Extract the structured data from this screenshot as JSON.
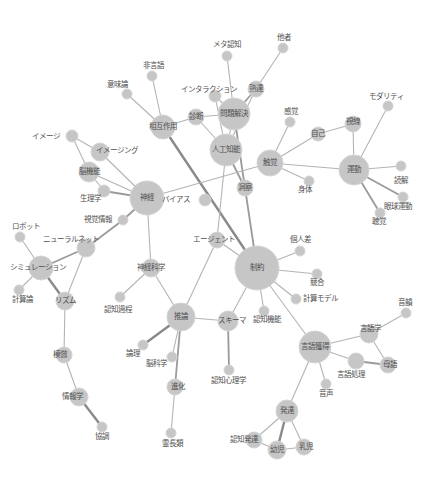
{
  "diagram": {
    "type": "network-graph",
    "colors": {
      "node": "#c6c6c6",
      "edge": "#b4b4b4",
      "edge_strong": "#8a8a8a",
      "label": "#505050",
      "background": "#ffffff"
    },
    "nodes": [
      {
        "id": "metacog",
        "label": "メタ認知",
        "x": 227,
        "y": 56,
        "r": 5,
        "lx": 227,
        "ly": 45
      },
      {
        "id": "tasha",
        "label": "他者",
        "x": 283,
        "y": 48,
        "r": 5,
        "lx": 284,
        "ly": 38
      },
      {
        "id": "higengo",
        "label": "非言語",
        "x": 152,
        "y": 76,
        "r": 5,
        "lx": 153,
        "ly": 66
      },
      {
        "id": "imiron",
        "label": "意味論",
        "x": 127,
        "y": 94,
        "r": 5,
        "lx": 117,
        "ly": 85
      },
      {
        "id": "interaction",
        "label": "インタラクション",
        "x": 215,
        "y": 96,
        "r": 6,
        "lx": 209,
        "ly": 90
      },
      {
        "id": "jukutatsu",
        "label": "熟達",
        "x": 256,
        "y": 89,
        "r": 8,
        "lx": 256,
        "ly": 89
      },
      {
        "id": "mondai",
        "label": "問題解決",
        "x": 234,
        "y": 114,
        "r": 16,
        "lx": 234,
        "ly": 114
      },
      {
        "id": "shindan",
        "label": "診断",
        "x": 196,
        "y": 117,
        "r": 8,
        "lx": 196,
        "ly": 117
      },
      {
        "id": "sougo",
        "label": "相互作用",
        "x": 163,
        "y": 127,
        "r": 12,
        "lx": 163,
        "ly": 127
      },
      {
        "id": "kankaku",
        "label": "感覚",
        "x": 290,
        "y": 122,
        "r": 5,
        "lx": 291,
        "ly": 112
      },
      {
        "id": "jiko",
        "label": "自己",
        "x": 318,
        "y": 134,
        "r": 7,
        "lx": 318,
        "ly": 134
      },
      {
        "id": "shisen",
        "label": "視線",
        "x": 353,
        "y": 124,
        "r": 8,
        "lx": 353,
        "ly": 122
      },
      {
        "id": "modality",
        "label": "モダリティ",
        "x": 388,
        "y": 106,
        "r": 5,
        "lx": 386,
        "ly": 97
      },
      {
        "id": "ai",
        "label": "人工知能",
        "x": 226,
        "y": 150,
        "r": 16,
        "lx": 226,
        "ly": 150
      },
      {
        "id": "image",
        "label": "イメージ",
        "x": 72,
        "y": 136,
        "r": 6,
        "lx": 46,
        "ly": 137
      },
      {
        "id": "imaging",
        "label": "イメージング",
        "x": 100,
        "y": 152,
        "r": 9,
        "lx": 117,
        "ly": 151
      },
      {
        "id": "nokino",
        "label": "脳機能",
        "x": 89,
        "y": 172,
        "r": 10,
        "lx": 89,
        "ly": 172
      },
      {
        "id": "shokkaku",
        "label": "触覚",
        "x": 270,
        "y": 163,
        "r": 13,
        "lx": 270,
        "ly": 163
      },
      {
        "id": "undou",
        "label": "運動",
        "x": 354,
        "y": 170,
        "r": 15,
        "lx": 354,
        "ly": 170
      },
      {
        "id": "dokkai",
        "label": "読解",
        "x": 401,
        "y": 166,
        "r": 5,
        "lx": 401,
        "ly": 181
      },
      {
        "id": "shintai",
        "label": "身体",
        "x": 309,
        "y": 181,
        "r": 5,
        "lx": 305,
        "ly": 190
      },
      {
        "id": "gankyu",
        "label": "眼球運動",
        "x": 403,
        "y": 197,
        "r": 5,
        "lx": 398,
        "ly": 207
      },
      {
        "id": "choukaku",
        "label": "聴覚",
        "x": 380,
        "y": 213,
        "r": 5,
        "lx": 379,
        "ly": 222
      },
      {
        "id": "dousatsu",
        "label": "洞察",
        "x": 245,
        "y": 188,
        "r": 8,
        "lx": 245,
        "ly": 188
      },
      {
        "id": "shinkei",
        "label": "神経",
        "x": 147,
        "y": 198,
        "r": 17,
        "lx": 147,
        "ly": 198
      },
      {
        "id": "seirigaku",
        "label": "生理学",
        "x": 104,
        "y": 191,
        "r": 6,
        "lx": 90,
        "ly": 199
      },
      {
        "id": "bias",
        "label": "バイアス",
        "x": 205,
        "y": 200,
        "r": 6,
        "lx": 176,
        "ly": 200
      },
      {
        "id": "shikaku",
        "label": "視覚情報",
        "x": 123,
        "y": 220,
        "r": 5,
        "lx": 98,
        "ly": 220
      },
      {
        "id": "agent",
        "label": "エージェント",
        "x": 217,
        "y": 240,
        "r": 8,
        "lx": 214,
        "ly": 240
      },
      {
        "id": "robot",
        "label": "ロボット",
        "x": 20,
        "y": 237,
        "r": 5,
        "lx": 26,
        "ly": 227
      },
      {
        "id": "neural",
        "label": "ニューラルネット",
        "x": 86,
        "y": 248,
        "r": 9,
        "lx": 71,
        "ly": 240
      },
      {
        "id": "simulation",
        "label": "シミュレーション",
        "x": 41,
        "y": 268,
        "r": 12,
        "lx": 38,
        "ly": 268
      },
      {
        "id": "seiyaku",
        "label": "制約",
        "x": 257,
        "y": 268,
        "r": 22,
        "lx": 257,
        "ly": 268
      },
      {
        "id": "kojinsa",
        "label": "個人差",
        "x": 300,
        "y": 251,
        "r": 5,
        "lx": 300,
        "ly": 240
      },
      {
        "id": "kyougou",
        "label": "競合",
        "x": 317,
        "y": 274,
        "r": 5,
        "lx": 317,
        "ly": 283
      },
      {
        "id": "shinkeikagaku",
        "label": "神経科学",
        "x": 151,
        "y": 268,
        "r": 9,
        "lx": 151,
        "ly": 268
      },
      {
        "id": "keisanron",
        "label": "計算論",
        "x": 19,
        "y": 290,
        "r": 5,
        "lx": 22,
        "ly": 300
      },
      {
        "id": "rhythm",
        "label": "リズム",
        "x": 65,
        "y": 301,
        "r": 9,
        "lx": 65,
        "ly": 301
      },
      {
        "id": "keisanmodel",
        "label": "計算モデル",
        "x": 296,
        "y": 299,
        "r": 5,
        "lx": 320,
        "ly": 299
      },
      {
        "id": "ninchikatei",
        "label": "認知過程",
        "x": 120,
        "y": 297,
        "r": 5,
        "lx": 118,
        "ly": 310
      },
      {
        "id": "ninchikino",
        "label": "認知機能",
        "x": 264,
        "y": 311,
        "r": 5,
        "lx": 267,
        "ly": 320
      },
      {
        "id": "suiron",
        "label": "推論",
        "x": 181,
        "y": 317,
        "r": 14,
        "lx": 181,
        "ly": 317
      },
      {
        "id": "schema",
        "label": "スキーマ",
        "x": 228,
        "y": 321,
        "r": 10,
        "lx": 232,
        "ly": 321
      },
      {
        "id": "onin",
        "label": "音韻",
        "x": 406,
        "y": 313,
        "r": 5,
        "lx": 405,
        "ly": 303
      },
      {
        "id": "gengogaku",
        "label": "言語学",
        "x": 369,
        "y": 334,
        "r": 9,
        "lx": 370,
        "ly": 329
      },
      {
        "id": "gengokakutoku",
        "label": "言語獲得",
        "x": 315,
        "y": 347,
        "r": 16,
        "lx": 315,
        "ly": 347
      },
      {
        "id": "ronri",
        "label": "論理",
        "x": 143,
        "y": 345,
        "r": 5,
        "lx": 133,
        "ly": 354
      },
      {
        "id": "noukagaku",
        "label": "脳科学",
        "x": 172,
        "y": 357,
        "r": 5,
        "lx": 156,
        "ly": 364
      },
      {
        "id": "ninchishinri",
        "label": "認知心理学",
        "x": 229,
        "y": 370,
        "r": 5,
        "lx": 228,
        "ly": 381
      },
      {
        "id": "bogo",
        "label": "母語",
        "x": 388,
        "y": 365,
        "r": 8,
        "lx": 390,
        "ly": 365
      },
      {
        "id": "gengoshori",
        "label": "言語処理",
        "x": 356,
        "y": 361,
        "r": 8,
        "lx": 351,
        "ly": 375
      },
      {
        "id": "mohou",
        "label": "模倣",
        "x": 64,
        "y": 355,
        "r": 8,
        "lx": 60,
        "ly": 355
      },
      {
        "id": "shinka",
        "label": "進化",
        "x": 175,
        "y": 387,
        "r": 8,
        "lx": 178,
        "ly": 387
      },
      {
        "id": "onsei",
        "label": "音声",
        "x": 326,
        "y": 384,
        "r": 5,
        "lx": 326,
        "ly": 394
      },
      {
        "id": "jouhougaku",
        "label": "情報学",
        "x": 79,
        "y": 397,
        "r": 9,
        "lx": 72,
        "ly": 397
      },
      {
        "id": "hattatsu",
        "label": "発達",
        "x": 287,
        "y": 411,
        "r": 11,
        "lx": 287,
        "ly": 411
      },
      {
        "id": "ninchihattatsu",
        "label": "認知発達",
        "x": 254,
        "y": 440,
        "r": 8,
        "lx": 244,
        "ly": 440
      },
      {
        "id": "youji",
        "label": "幼児",
        "x": 277,
        "y": 450,
        "r": 9,
        "lx": 277,
        "ly": 450
      },
      {
        "id": "nyuuji",
        "label": "乳児",
        "x": 304,
        "y": 447,
        "r": 8,
        "lx": 306,
        "ly": 447
      },
      {
        "id": "kyouchou",
        "label": "協調",
        "x": 102,
        "y": 427,
        "r": 5,
        "lx": 102,
        "ly": 437
      },
      {
        "id": "reichourui",
        "label": "霊長類",
        "x": 171,
        "y": 433,
        "r": 5,
        "lx": 172,
        "ly": 444
      }
    ],
    "edges": [
      [
        "metacog",
        "mondai",
        1
      ],
      [
        "tasha",
        "jukutatsu",
        1
      ],
      [
        "higengo",
        "sougo",
        1
      ],
      [
        "imiron",
        "sougo",
        1
      ],
      [
        "interaction",
        "mondai",
        1
      ],
      [
        "interaction",
        "ai",
        1
      ],
      [
        "jukutatsu",
        "mondai",
        2
      ],
      [
        "jukutatsu",
        "ai",
        1
      ],
      [
        "shindan",
        "sougo",
        1
      ],
      [
        "shindan",
        "mondai",
        1
      ],
      [
        "shindan",
        "ai",
        1
      ],
      [
        "sougo",
        "seiyaku",
        3
      ],
      [
        "mondai",
        "ai",
        1
      ],
      [
        "mondai",
        "dousatsu",
        2
      ],
      [
        "ai",
        "dousatsu",
        2
      ],
      [
        "ai",
        "agent",
        1
      ],
      [
        "dousatsu",
        "seiyaku",
        2
      ],
      [
        "shokkaku",
        "kankaku",
        1
      ],
      [
        "shokkaku",
        "jiko",
        1
      ],
      [
        "shokkaku",
        "shintai",
        1
      ],
      [
        "shokkaku",
        "undou",
        1
      ],
      [
        "shokkaku",
        "shinkei",
        1
      ],
      [
        "jiko",
        "shisen",
        1
      ],
      [
        "shisen",
        "undou",
        1
      ],
      [
        "modality",
        "undou",
        1
      ],
      [
        "undou",
        "dokkai",
        1
      ],
      [
        "undou",
        "gankyu",
        2
      ],
      [
        "undou",
        "choukaku",
        2
      ],
      [
        "image",
        "imaging",
        1
      ],
      [
        "image",
        "nokino",
        1
      ],
      [
        "imaging",
        "shinkei",
        1
      ],
      [
        "nokino",
        "shinkei",
        1
      ],
      [
        "nokino",
        "seirigaku",
        1
      ],
      [
        "seirigaku",
        "shinkei",
        2
      ],
      [
        "shinkei",
        "shikaku",
        2
      ],
      [
        "shinkei",
        "shinkeikagaku",
        1
      ],
      [
        "shikaku",
        "neural",
        2
      ],
      [
        "neural",
        "simulation",
        2
      ],
      [
        "neural",
        "rhythm",
        1
      ],
      [
        "robot",
        "simulation",
        1
      ],
      [
        "simulation",
        "keisanron",
        1
      ],
      [
        "simulation",
        "rhythm",
        3
      ],
      [
        "rhythm",
        "mohou",
        1
      ],
      [
        "mohou",
        "jouhougaku",
        1
      ],
      [
        "jouhougaku",
        "kyouchou",
        3
      ],
      [
        "shinkeikagaku",
        "ninchikatei",
        1
      ],
      [
        "shinkeikagaku",
        "suiron",
        1
      ],
      [
        "agent",
        "suiron",
        1
      ],
      [
        "agent",
        "seiyaku",
        1
      ],
      [
        "seiyaku",
        "kojinsa",
        1
      ],
      [
        "seiyaku",
        "kyougou",
        1
      ],
      [
        "seiyaku",
        "keisanmodel",
        1
      ],
      [
        "seiyaku",
        "ninchikino",
        1
      ],
      [
        "seiyaku",
        "schema",
        1
      ],
      [
        "seiyaku",
        "gengokakutoku",
        1
      ],
      [
        "suiron",
        "schema",
        1
      ],
      [
        "suiron",
        "ronri",
        3
      ],
      [
        "suiron",
        "noukagaku",
        1
      ],
      [
        "suiron",
        "shinka",
        2
      ],
      [
        "schema",
        "ninchishinri",
        2
      ],
      [
        "shinka",
        "reichourui",
        1
      ],
      [
        "gengokakutoku",
        "gengogaku",
        1
      ],
      [
        "gengokakutoku",
        "gengoshori",
        1
      ],
      [
        "gengokakutoku",
        "onsei",
        1
      ],
      [
        "gengokakutoku",
        "hattatsu",
        1
      ],
      [
        "gengogaku",
        "onin",
        1
      ],
      [
        "gengogaku",
        "bogo",
        1
      ],
      [
        "gengoshori",
        "bogo",
        2
      ],
      [
        "hattatsu",
        "ninchihattatsu",
        1
      ],
      [
        "hattatsu",
        "youji",
        3
      ],
      [
        "hattatsu",
        "nyuuji",
        1
      ],
      [
        "ninchihattatsu",
        "youji",
        1
      ],
      [
        "youji",
        "nyuuji",
        1
      ]
    ]
  }
}
